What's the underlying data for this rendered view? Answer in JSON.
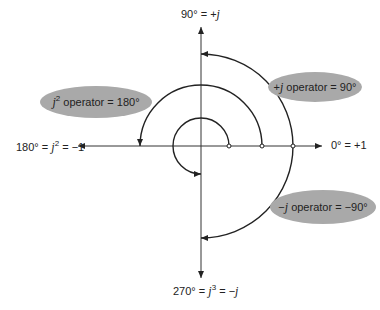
{
  "axes": {
    "top_label": "90° = +j",
    "right_label": "0° = +1",
    "left_label": "180° = j² = −1",
    "bottom_label": "270° = j³ = −j"
  },
  "operators": [
    {
      "name": "j-squared",
      "label": "j² operator = 180°",
      "arc_start_deg": 0,
      "arc_end_deg": 180,
      "radius": 61
    },
    {
      "name": "plus-j",
      "label": "+j operator = 90°",
      "arc_start_deg": 0,
      "arc_end_deg": 90,
      "radius": 92
    },
    {
      "name": "minus-j",
      "label": "−j operator = −90°",
      "arc_start_deg": 0,
      "arc_end_deg": -90,
      "radius": 92
    },
    {
      "name": "j-cubed",
      "label": "",
      "arc_start_deg": 0,
      "arc_end_deg": 270,
      "radius": 28
    }
  ],
  "colors": {
    "oval": "#a9a9a9",
    "line": "#222222"
  }
}
